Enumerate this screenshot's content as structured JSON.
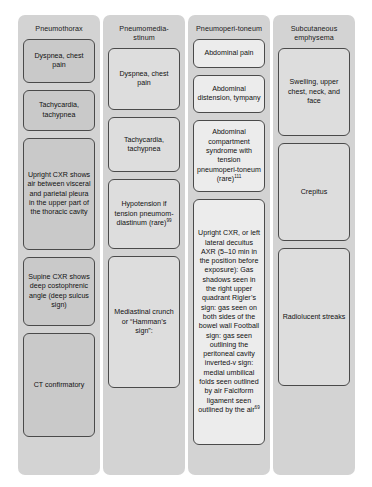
{
  "diagram": {
    "type": "comparison-table-flowchart",
    "columns": [
      {
        "header": "Pneumothorax",
        "boxes": [
          {
            "text": "Dyspnea, chest pain"
          },
          {
            "text": "Tachycardia, tachypnea"
          },
          {
            "text": "Upright CXR shows air between visceral and parietal pleura in the upper part of the thoracic cavity"
          },
          {
            "text": "Supine CXR shows deep costophrenic angle (deep sulcus sign)"
          },
          {
            "text": "CT confirmatory"
          }
        ]
      },
      {
        "header": "Pneumomedia-stinum",
        "boxes": [
          {
            "text": "Dyspnea, chest pain"
          },
          {
            "text": "Tachycardia, tachypnea"
          },
          {
            "text": "Hypotension if tension pneumom-diastinum (rare)",
            "superscript": "99"
          },
          {
            "text": "Mediastinal crunch or “Hamman’s sign”:"
          }
        ]
      },
      {
        "header": "Pneumoperi-toneum",
        "boxes": [
          {
            "text": "Abdominal pain"
          },
          {
            "text": "Abdominal distension, tympany"
          },
          {
            "text": "Abdominal compartment syndrome with tension pneumoperi-toneum (rare)",
            "superscript": "111"
          },
          {
            "text": "Upright CXR, or left lateral decuitus AXR (5–10 min in the position before exposure): Gas shadows seen in the right upper quadrant Rigler’s sign: gas seen on both sides of the bowel wall Football sign: gas seen outlining the peritoneal cavity inverted-v sign: medial umbilical folds seen outlined by air Falciform ligament seen outlined by the air",
            "superscript": "69"
          }
        ]
      },
      {
        "header": "Subcutaneous emphysema",
        "boxes": [
          {
            "text": "Swelling, upper chest, neck, and face"
          },
          {
            "text": "Crepitus"
          },
          {
            "text": "Radiolucent streaks"
          }
        ]
      }
    ]
  },
  "colors": {
    "page_background": "#ffffff",
    "column_background": "#d3d3d3",
    "box_fill_col1": "#c9c9c9",
    "box_fill_col2": "#dddddd",
    "box_fill_col3": "#ececec",
    "box_fill_col4": "#dddddd",
    "box_border": "#4a4a4a",
    "text": "#111111"
  }
}
